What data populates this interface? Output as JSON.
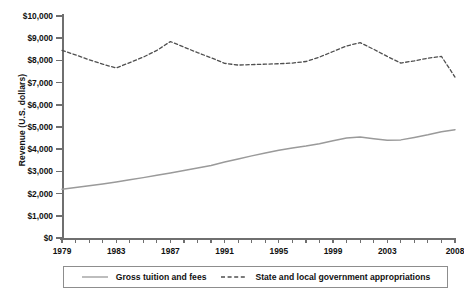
{
  "chart_data": {
    "type": "line",
    "title": "",
    "xlabel": "",
    "ylabel": "Revenue (U.S. dollars)",
    "xlim": [
      1979,
      2008
    ],
    "ylim": [
      0,
      10000
    ],
    "grid": false,
    "legend_position": "bottom",
    "x": [
      1979,
      1980,
      1981,
      1982,
      1983,
      1984,
      1985,
      1986,
      1987,
      1988,
      1989,
      1990,
      1991,
      1992,
      1993,
      1994,
      1995,
      1996,
      1997,
      1998,
      1999,
      2000,
      2001,
      2002,
      2003,
      2004,
      2005,
      2006,
      2007,
      2008
    ],
    "xticks": [
      1979,
      1983,
      1987,
      1991,
      1995,
      1999,
      2003,
      2008
    ],
    "xtick_labels": [
      "1979",
      "1983",
      "1987",
      "1991",
      "1995",
      "1999",
      "2003",
      "2008"
    ],
    "yticks": [
      0,
      1000,
      2000,
      3000,
      4000,
      5000,
      6000,
      7000,
      8000,
      9000,
      10000
    ],
    "ytick_labels": [
      "$0",
      "$1,000",
      "$2,000",
      "$3,000",
      "$4,000",
      "$5,000",
      "$6,000",
      "$7,000",
      "$8,000",
      "$9,000",
      "$10,000"
    ],
    "series": [
      {
        "name": "Gross tuition and fees",
        "style": "solid",
        "color": "#9a9a9a",
        "values": [
          2200,
          2270,
          2350,
          2430,
          2520,
          2620,
          2720,
          2830,
          2930,
          3040,
          3150,
          3270,
          3420,
          3560,
          3700,
          3830,
          3950,
          4050,
          4140,
          4250,
          4380,
          4500,
          4550,
          4470,
          4400,
          4420,
          4530,
          4650,
          4790,
          4880
        ]
      },
      {
        "name": "State and local government appropriations",
        "style": "dashed",
        "color": "#4f4f4f",
        "values": [
          8450,
          8250,
          8030,
          7830,
          7660,
          7900,
          8150,
          8450,
          8850,
          8600,
          8350,
          8120,
          7870,
          7790,
          7810,
          7830,
          7850,
          7880,
          7950,
          8150,
          8400,
          8650,
          8800,
          8500,
          8180,
          7880,
          7980,
          8100,
          8180,
          7250
        ]
      }
    ]
  },
  "legend": {
    "items": [
      {
        "label": "Gross tuition and fees",
        "style": "solid"
      },
      {
        "label": "State and local government appropriations",
        "style": "dashed"
      }
    ]
  }
}
